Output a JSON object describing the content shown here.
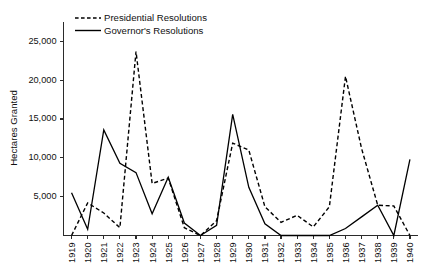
{
  "chart_data": {
    "type": "line",
    "title": "",
    "xlabel": "",
    "ylabel": "Hectares Granted",
    "ylim": [
      0,
      27500
    ],
    "yticks": [
      5000,
      10000,
      15000,
      20000,
      25000
    ],
    "ytick_labels": [
      "5,000",
      "10,000",
      "15,000",
      "20,000",
      "25,000"
    ],
    "grid": false,
    "legend_position": "top-left",
    "categories": [
      "1919",
      "1920",
      "1921",
      "1922",
      "1923",
      "1924",
      "1925",
      "1926",
      "1927",
      "1928",
      "1929",
      "1930",
      "1931",
      "1932",
      "1933",
      "1934",
      "1935",
      "1936",
      "1937",
      "1938",
      "1939",
      "1940"
    ],
    "series": [
      {
        "name": "Presidential Resolutions",
        "style": "dashed",
        "values": [
          0,
          4200,
          2900,
          1000,
          23700,
          6700,
          7400,
          1000,
          0,
          1900,
          11900,
          11000,
          3700,
          1700,
          2600,
          1100,
          3700,
          20500,
          11200,
          3900,
          3800,
          0
        ]
      },
      {
        "name": "Governor's Resolutions",
        "style": "solid",
        "values": [
          5500,
          800,
          13600,
          9300,
          8100,
          2800,
          7500,
          1600,
          0,
          1300,
          15600,
          6200,
          1500,
          0,
          0,
          0,
          0,
          900,
          2400,
          3900,
          0,
          9800
        ]
      }
    ]
  }
}
